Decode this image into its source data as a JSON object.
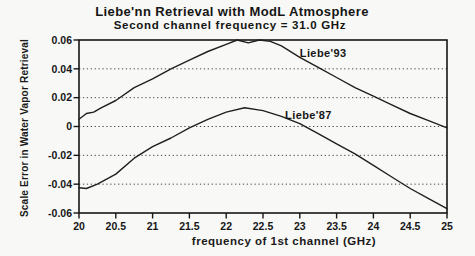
{
  "figure": {
    "background": "#f8f8f6",
    "frame_color": "#161616",
    "grid_color": "#4a4a4a",
    "line_color": "#1f1f1f"
  },
  "chart_data": {
    "type": "line",
    "title": "Liebe'nn Retrieval with ModL Atmosphere",
    "subtitle": "Second channel frequency = 31.0 GHz",
    "xlabel": "frequency of 1st channel (GHz)",
    "ylabel": "Scale Error in Water Vapor Retrieval",
    "xlim": [
      20,
      25
    ],
    "ylim": [
      -0.06,
      0.06
    ],
    "x_ticks": [
      "20",
      "20.5",
      "21",
      "21.5",
      "22",
      "22.5",
      "23",
      "23.5",
      "24",
      "24.5",
      "25"
    ],
    "y_ticks": [
      "0.06",
      "0.04",
      "0.02",
      "0",
      "-0.02",
      "-0.04",
      "-0.06"
    ],
    "grid": {
      "style": "horizontal-dotted",
      "at": [
        0.04,
        0.02,
        0,
        -0.02,
        -0.04
      ]
    },
    "frame": "box",
    "legend_position": "inline-annotations",
    "series": [
      {
        "name": "Liebe'93",
        "label_anchor": {
          "x": 23.0,
          "y": 0.048
        },
        "x": [
          20.0,
          20.1,
          20.2,
          20.3,
          20.5,
          20.75,
          21.0,
          21.25,
          21.5,
          21.75,
          22.0,
          22.15,
          22.3,
          22.45,
          22.6,
          22.75,
          23.0,
          23.25,
          23.5,
          23.75,
          24.0,
          24.25,
          24.5,
          24.75,
          25.0
        ],
        "y": [
          0.005,
          0.009,
          0.01,
          0.013,
          0.018,
          0.027,
          0.033,
          0.04,
          0.046,
          0.052,
          0.057,
          0.06,
          0.058,
          0.06,
          0.059,
          0.056,
          0.048,
          0.041,
          0.034,
          0.027,
          0.021,
          0.015,
          0.009,
          0.004,
          -0.001
        ]
      },
      {
        "name": "Liebe'87",
        "label_anchor": {
          "x": 22.8,
          "y": 0.005
        },
        "x": [
          20.0,
          20.1,
          20.25,
          20.5,
          20.75,
          21.0,
          21.25,
          21.5,
          21.75,
          22.0,
          22.25,
          22.5,
          22.75,
          23.0,
          23.25,
          23.5,
          23.75,
          24.0,
          24.25,
          24.5,
          24.75,
          25.0
        ],
        "y": [
          -0.0425,
          -0.043,
          -0.04,
          -0.033,
          -0.022,
          -0.014,
          -0.008,
          -0.001,
          0.005,
          0.01,
          0.013,
          0.011,
          0.007,
          0.002,
          -0.005,
          -0.012,
          -0.019,
          -0.027,
          -0.035,
          -0.043,
          -0.05,
          -0.057
        ]
      }
    ]
  }
}
